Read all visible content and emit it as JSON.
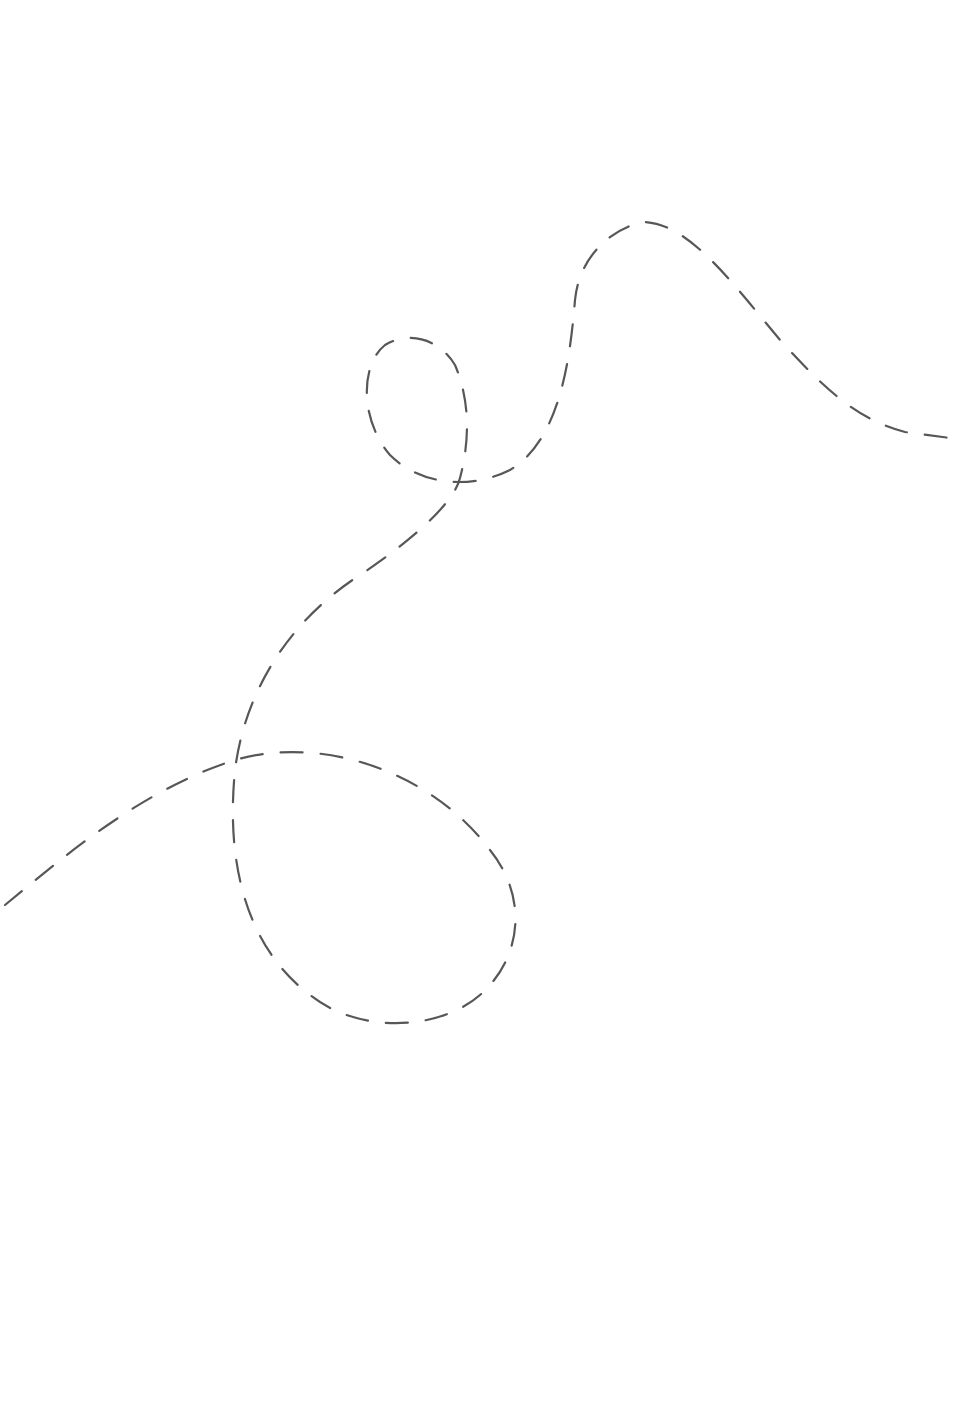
{
  "drawing": {
    "description": "Hand-drawn pencil dashed line forming a meandering path with a small loop near the top-center and a large loop in the lower-left region",
    "stroke_color": "#3a3a3a",
    "background_color": "#ffffff",
    "style": "dashed pencil line"
  }
}
